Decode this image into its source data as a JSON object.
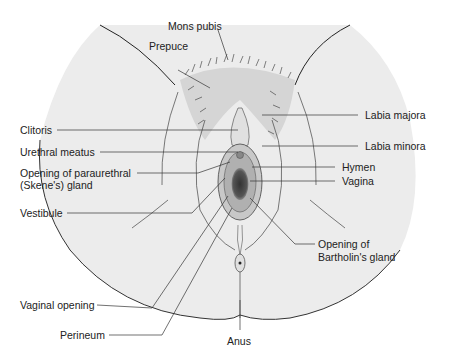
{
  "figure": {
    "type": "anatomical-illustration",
    "colors": {
      "background": "#ffffff",
      "skin_shade": "#e6e6e6",
      "line": "#333333",
      "text": "#222222"
    }
  },
  "labels": {
    "mons_pubis": "Mons pubis",
    "prepuce": "Prepuce",
    "clitoris": "Clitoris",
    "urethral_meatus": "Urethral meatus",
    "paraurethral_1": "Opening of paraurethral",
    "paraurethral_2": "(Skene's) gland",
    "vestibule": "Vestibule",
    "vaginal_opening": "Vaginal opening",
    "perineum": "Perineum",
    "labia_majora": "Labia majora",
    "labia_minora": "Labia minora",
    "hymen": "Hymen",
    "vagina": "Vagina",
    "bartholin_1": "Opening of",
    "bartholin_2": "Bartholin's gland",
    "anus": "Anus"
  }
}
